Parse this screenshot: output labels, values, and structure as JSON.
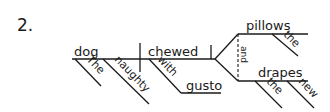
{
  "problem_number": "2.",
  "diagram": {
    "type": "sentence-diagram",
    "sentence_words": [
      "The",
      "naughty",
      "dog",
      "chewed",
      "with",
      "gusto",
      "the",
      "pillows",
      "and",
      "the",
      "new",
      "drapes"
    ],
    "subject": {
      "word": "dog",
      "modifiers": [
        "The",
        "naughty"
      ]
    },
    "verb": {
      "word": "chewed",
      "modifiers": [
        {
          "preposition": "with",
          "object": "gusto"
        }
      ]
    },
    "compound_direct_object": {
      "conjunction": "and",
      "objects": [
        {
          "word": "pillows",
          "modifiers": [
            "the"
          ]
        },
        {
          "word": "drapes",
          "modifiers": [
            "the",
            "new"
          ]
        }
      ]
    }
  }
}
